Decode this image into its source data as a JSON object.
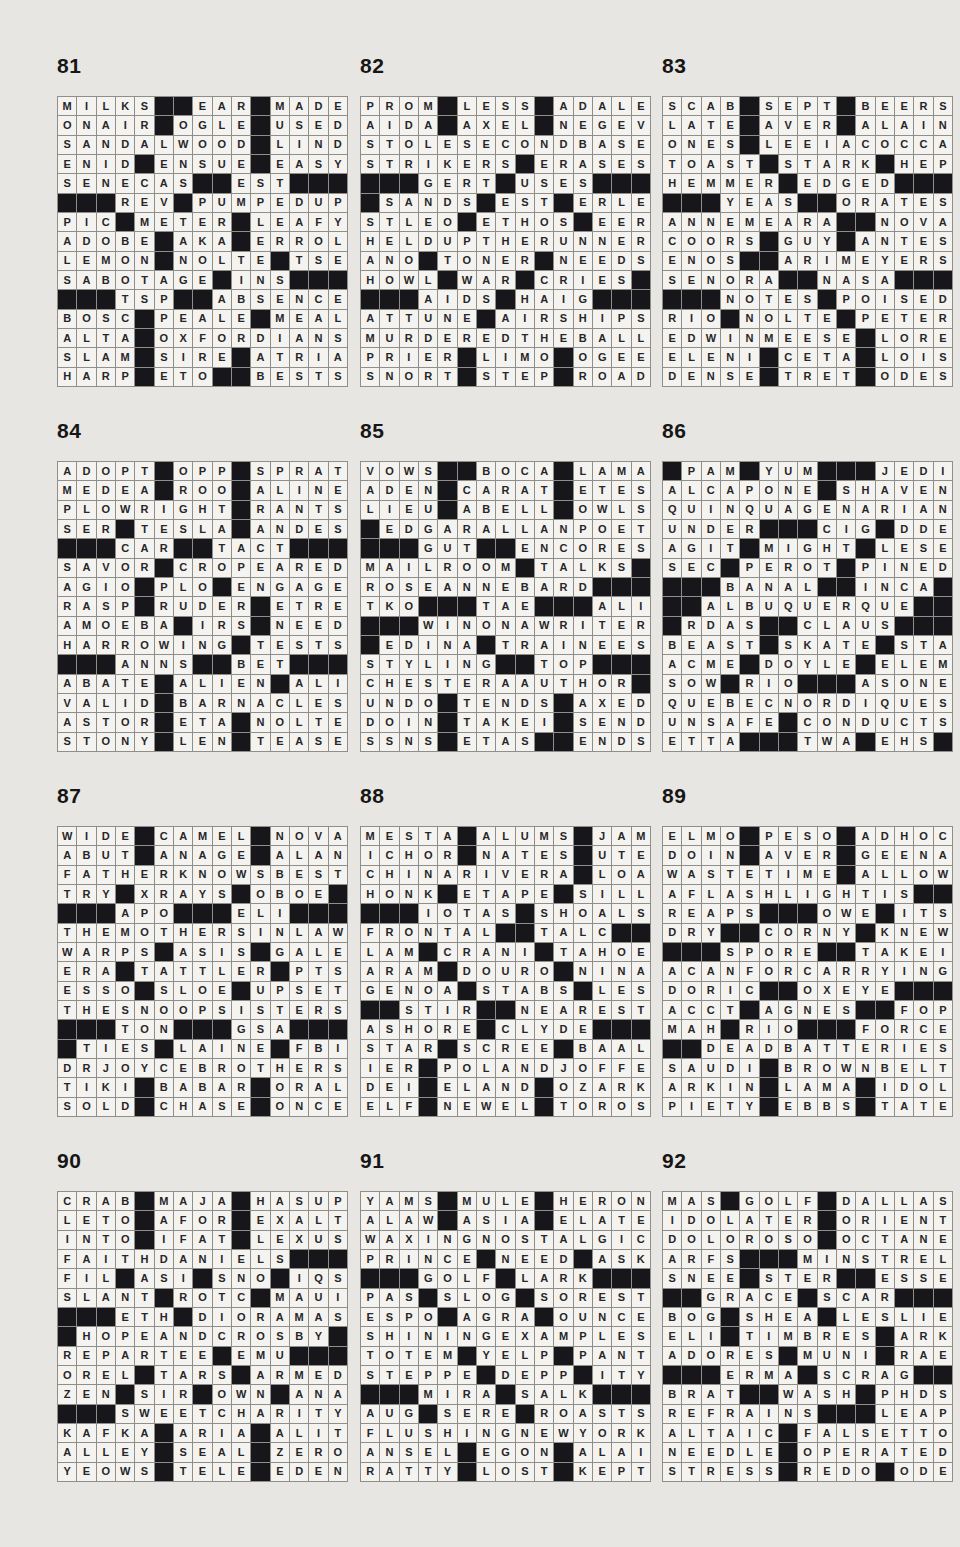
{
  "page": {
    "paper_color": "#e8e6e2",
    "black_square_color": "#17161a",
    "cell_color": "#f4f3ef",
    "grid_line_color": "#8f8e89",
    "black_square_symbol": "."
  },
  "puzzles": [
    {
      "number": "81",
      "grid": [
        "MILKS..EAR.MADE",
        "ONAIR.OGLE.USED",
        "SANDALWOOD.LIND",
        "ENID.ENSUE.EASY",
        "SENECAS..EST...",
        "...REV.PUMPEDUP",
        "PIC.METER.LEAFY",
        "ADOBE.AKA.ERROL",
        "LEMON.NOLTE.TSE",
        "SABOTAGE.INS...",
        "...TSP..ABSENCE",
        "BOSC.PEALE.MEAL",
        "ALTA.OXFORDIANS",
        "SLAM.SIRE.ATRIA",
        "HARP.ETO..BESTS"
      ]
    },
    {
      "number": "82",
      "grid": [
        "PROM.LESS.ADALE",
        "AIDA.AXEL.NEGEV",
        "STOLESECONDBASE",
        "STRIKERS.ERASES",
        "...GERT.USES...",
        ".SANDS.EST.ERLE",
        "STLEO.ETHOS.EER",
        "HELDUPTHERUNNER",
        "ANO.TONER.NEEDS",
        "HOWL.WAR.CRIES.",
        "...AIDS.HAIG...",
        "ATTUNE.AIRSHIPS",
        "MURDEREDTHEBALL",
        "PRIER.LIMO.OGEE",
        "SNORT.STEP.ROAD"
      ]
    },
    {
      "number": "83",
      "grid": [
        "SCAB.SEPT.BEERS",
        "LATE.AVER.ALAIN",
        "ONES.LEEIACOCCA",
        "TOAST.STARK.HEP",
        "HEMMER.EDGED...",
        "...YEAS..ORATES",
        "ANNEMEARA..NOVA",
        "COORS.GUY.ANTES",
        "ENOS..ARIMEYERS",
        "SENORA..NASA...",
        "...NOTES.POISED",
        "RIO.NOLTE.PETER",
        "EDWINMEESE.LORE",
        "ELENI.CETA.LOIS",
        "DENSE.TRET.ODES"
      ]
    },
    {
      "number": "84",
      "grid": [
        "ADOPT.OPP.SPRAT",
        "MEDEA.ROO.ALINE",
        "PLOWRIGHT.RANTS",
        "SER.TESLA.ANDES",
        "...CAR..TACT...",
        "SAVOR.CROPEARED",
        "AGIO.PLO.ENGAGE",
        "RASP.RUDER.ETRE",
        "AMOEBA.IRS.NEED",
        "HARROWING.TESTS",
        "...ANNS..BET...",
        "ABATE.ALIEN.ALI",
        "VALID.BARNACLES",
        "ASTOR.ETA.NOLTE",
        "STONY.LEN.TEASE"
      ]
    },
    {
      "number": "85",
      "grid": [
        "VOWS..BOCA.LAMA",
        "ADEN.CARAT.ETES",
        "LIEU.ABELL.OWLS",
        ".EDGARALLANPOET",
        "...GUT..ENCORES",
        "MAILROOM.TALKS.",
        "ROSEANNEBARD...",
        "TKO...TAE...ALI",
        "...WINONAWRITER",
        ".EDINA.TRAINEES",
        "STYLING..TOP...",
        "CHESTERAAUTHOR.",
        "UNDO.TENDS.AXED",
        "DOIN.TAKEI.SEND",
        "SSNS.ETAS..ENDS"
      ]
    },
    {
      "number": "86",
      "grid": [
        ".PAM.YUM...JEDI",
        "ALCAPONE.SHAVEN",
        "QUINQUAGENARIAN",
        "UNDER...CIG.DDE",
        "AGIT.MIGHT.LESE",
        "SEC.PEROT.PINED",
        "...BANAL..INCA.",
        "..ALBUQUERQUE..",
        ".RDAS..CLAUS...",
        "BEAST.SKATE.STA",
        "ACME.DOYLE.ELEM",
        "SOW.RIO...ASONE",
        "QUEBECNORDIQUES",
        "UNSAFE.CONDUCTS",
        "ETTA...TWA.EHS."
      ]
    },
    {
      "number": "87",
      "grid": [
        "WIDE.CAMEL.NOVA",
        "ABUT.ANAGE.ALAN",
        "FATHERKNOWSBEST",
        "TRY.XRAYS.OBOE.",
        "...APO...ELI...",
        "THEMOTHERSINLAW",
        "WARPS.ASIS.GALE",
        "ERA.TATTLER.PTS",
        "ESSO.SLOE.UPSET",
        "THESNOOPSISTERS",
        "...TON...GSA...",
        ".TIES.LAINE.FBI",
        "DRJOYCEBROTHERS",
        "TIKI.BABAR.ORAL",
        "SOLD.CHASE.ONCE"
      ]
    },
    {
      "number": "88",
      "grid": [
        "MESTA.ALUMS.JAM",
        "ICHOR.NATES.UTE",
        "CHINARIVERA.LOA",
        "HONK.ETAPE.SILL",
        "...IOTAS.SHOALS",
        "FRONTAL..TALC..",
        "LAM.CRANI.TAHOE",
        "ARAM.DOURO.NINA",
        "GENOA.STABS.LES",
        "..STIR..NEAREST",
        "ASHORE.CLYDE...",
        "STAR.SCREE.BAAL",
        "IER.POLANDJOFFE",
        "DEI.ELAND.OZARK",
        "ELF.NEWEL.TOROS"
      ]
    },
    {
      "number": "89",
      "grid": [
        "ELMO.PESO.ADHOC",
        "DOIN.AVER.GEENA",
        "WASTETIME.ALLOW",
        "AFLASHLIGHTIS..",
        "REAPS...OWE.ITS",
        "DRY..CORNY.KNEW",
        "...SPORE..TAKEI",
        "ACANFORCARRYING",
        "DORIC..OXEYE...",
        "ACCT.AGNES..FOP",
        "MAH.RIO...FORCE",
        "..DEADBATTERIES",
        "SAUDI.BROWNBELT",
        "ARKIN.LAMA.IDOL",
        "PIETY.EBBS.TATE"
      ]
    },
    {
      "number": "90",
      "grid": [
        "CRAB.MAJA.HASUP",
        "LETO.AFOR.EXALT",
        "INTO.IFAT.LEXUS",
        "FAITHDANIELS...",
        "FIL.ASI.SNO.IQS",
        "SLANT.ROTC.MAUI",
        "...ETH.DIORAMAS",
        ".HOPEANDCROSBY.",
        "REPARTEE.EMU...",
        "OREL.TARS.ARMED",
        "ZEN.SIR.OWN.ANA",
        "...SWEETCHARITY",
        "KAFKA.ARIA.ALIT",
        "ALLEY.SEAL.ZERO",
        "YEOWS.TELE.EDEN"
      ]
    },
    {
      "number": "91",
      "grid": [
        "YAMS.MULE.HERON",
        "ALAW.ASIA.ELATE",
        "WAXINGNOSTALGIC",
        "PRINCE.NEED.ASK",
        "...GOLF.LARK...",
        "PAS.SLOG.SOREST",
        "ESPO.AGRA.OUNCE",
        "SHININGEXAMPLES",
        "TOTEM.YELP.PANT",
        "STEPPE.DEPP.ITY",
        "...MIRA.SALK...",
        "AUG.SERE.ROASTS",
        "FLUSHINGNEWYORK",
        "ANSEL.EGON.ALAI",
        "RATTY.LOST.KEPT"
      ]
    },
    {
      "number": "92",
      "grid": [
        "MAS.GOLF.DALLAS",
        "IDOLATER.ORIENT",
        "DOLOROSO.OCTANE",
        "ARFS...MINSTREL",
        "SNEE.STER..ESSE",
        "..GRACE.SCAR...",
        "BOG.SHEA.LESLIE",
        "ELI.TIMBRES.ARK",
        "ADORES.MUNI.RAE",
        "...ERMA.SCRAG..",
        "BRAT..WASH.PHDS",
        "REFRAINS...LEAP",
        "ALTAIC.FALSETTO",
        "NEEDLE.OPERATED",
        "STRESS.REDO.ODE"
      ]
    }
  ]
}
